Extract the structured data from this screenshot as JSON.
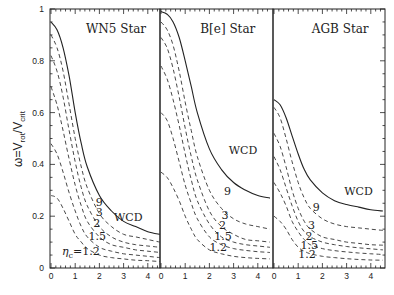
{
  "chart_data": {
    "type": "line",
    "ylabel": "ω=V_rot/V_crit",
    "ylim": [
      0,
      1
    ],
    "xlim": [
      0,
      4.5
    ],
    "yticks": [
      "0",
      "0.2",
      "0.4",
      "0.6",
      "0.8",
      "1"
    ],
    "xticks": [
      "0",
      "1",
      "2",
      "3",
      "4"
    ],
    "panels": [
      {
        "title": "WN5 Star",
        "annotations": [
          {
            "text": "WCD",
            "x": 2.6,
            "y": 0.18
          },
          {
            "text": "9",
            "x": 1.85,
            "y": 0.24
          },
          {
            "text": "3",
            "x": 1.85,
            "y": 0.2
          },
          {
            "text": "2",
            "x": 1.75,
            "y": 0.16
          },
          {
            "text": "1.5",
            "x": 1.55,
            "y": 0.11
          },
          {
            "text": "η_c=1.2",
            "x": 0.45,
            "y": 0.05
          }
        ],
        "series": [
          {
            "name": "WCD",
            "style": "solid",
            "x": [
              0,
              0.25,
              0.5,
              0.75,
              1,
              1.25,
              1.5,
              2,
              2.5,
              3,
              3.5,
              4,
              4.5
            ],
            "y": [
              0.95,
              0.92,
              0.85,
              0.74,
              0.6,
              0.48,
              0.39,
              0.28,
              0.22,
              0.18,
              0.16,
              0.14,
              0.13
            ]
          },
          {
            "name": "9",
            "style": "dashed",
            "x": [
              0,
              0.25,
              0.5,
              0.75,
              1,
              1.25,
              1.5,
              2,
              2.5,
              3,
              3.5,
              4,
              4.5
            ],
            "y": [
              0.9,
              0.85,
              0.76,
              0.63,
              0.5,
              0.39,
              0.31,
              0.21,
              0.16,
              0.13,
              0.12,
              0.11,
              0.1
            ]
          },
          {
            "name": "3",
            "style": "dashed",
            "x": [
              0,
              0.25,
              0.5,
              0.75,
              1,
              1.25,
              1.5,
              2,
              2.5,
              3,
              3.5,
              4,
              4.5
            ],
            "y": [
              0.82,
              0.76,
              0.66,
              0.53,
              0.41,
              0.31,
              0.24,
              0.16,
              0.12,
              0.1,
              0.09,
              0.085,
              0.08
            ]
          },
          {
            "name": "2",
            "style": "dashed",
            "x": [
              0,
              0.25,
              0.5,
              0.75,
              1,
              1.25,
              1.5,
              2,
              2.5,
              3,
              3.5,
              4,
              4.5
            ],
            "y": [
              0.7,
              0.63,
              0.53,
              0.42,
              0.32,
              0.24,
              0.18,
              0.12,
              0.09,
              0.08,
              0.07,
              0.065,
              0.06
            ]
          },
          {
            "name": "1.5",
            "style": "dashed",
            "x": [
              0,
              0.25,
              0.5,
              0.75,
              1,
              1.25,
              1.5,
              2,
              2.5,
              3,
              3.5,
              4,
              4.5
            ],
            "y": [
              0.48,
              0.44,
              0.37,
              0.29,
              0.22,
              0.16,
              0.12,
              0.08,
              0.065,
              0.055,
              0.05,
              0.045,
              0.04
            ]
          },
          {
            "name": "1.2",
            "style": "dashed",
            "x": [
              0,
              0.25,
              0.5,
              0.75,
              1,
              1.25,
              1.5,
              2,
              2.5,
              3,
              3.5,
              4,
              4.5
            ],
            "y": [
              0.28,
              0.27,
              0.23,
              0.18,
              0.13,
              0.1,
              0.075,
              0.05,
              0.04,
              0.035,
              0.03,
              0.028,
              0.025
            ]
          }
        ]
      },
      {
        "title": "B[e] Star",
        "annotations": [
          {
            "text": "WCD",
            "x": 2.8,
            "y": 0.44
          },
          {
            "text": "9",
            "x": 2.6,
            "y": 0.28
          },
          {
            "text": "3",
            "x": 2.5,
            "y": 0.19
          },
          {
            "text": "2",
            "x": 2.4,
            "y": 0.15
          },
          {
            "text": "1.5",
            "x": 2.2,
            "y": 0.11
          },
          {
            "text": "1.2",
            "x": 2.0,
            "y": 0.065
          }
        ],
        "series": [
          {
            "name": "WCD",
            "style": "solid",
            "x": [
              0,
              0.25,
              0.5,
              0.75,
              1,
              1.25,
              1.5,
              2,
              2.5,
              3,
              3.5,
              4,
              4.5
            ],
            "y": [
              0.99,
              0.98,
              0.95,
              0.89,
              0.8,
              0.7,
              0.6,
              0.46,
              0.38,
              0.33,
              0.3,
              0.28,
              0.27
            ]
          },
          {
            "name": "9",
            "style": "dashed",
            "x": [
              0,
              0.25,
              0.5,
              0.75,
              1,
              1.25,
              1.5,
              2,
              2.5,
              3,
              3.5,
              4,
              4.5
            ],
            "y": [
              0.95,
              0.92,
              0.86,
              0.76,
              0.64,
              0.53,
              0.43,
              0.3,
              0.23,
              0.19,
              0.17,
              0.16,
              0.15
            ]
          },
          {
            "name": "3",
            "style": "dashed",
            "x": [
              0,
              0.25,
              0.5,
              0.75,
              1,
              1.25,
              1.5,
              2,
              2.5,
              3,
              3.5,
              4,
              4.5
            ],
            "y": [
              0.89,
              0.85,
              0.77,
              0.66,
              0.54,
              0.43,
              0.34,
              0.22,
              0.16,
              0.13,
              0.11,
              0.105,
              0.1
            ]
          },
          {
            "name": "2",
            "style": "dashed",
            "x": [
              0,
              0.25,
              0.5,
              0.75,
              1,
              1.25,
              1.5,
              2,
              2.5,
              3,
              3.5,
              4,
              4.5
            ],
            "y": [
              0.78,
              0.73,
              0.65,
              0.55,
              0.44,
              0.34,
              0.26,
              0.17,
              0.12,
              0.1,
              0.09,
              0.085,
              0.08
            ]
          },
          {
            "name": "1.5",
            "style": "dashed",
            "x": [
              0,
              0.25,
              0.5,
              0.75,
              1,
              1.25,
              1.5,
              2,
              2.5,
              3,
              3.5,
              4,
              4.5
            ],
            "y": [
              0.6,
              0.57,
              0.5,
              0.41,
              0.32,
              0.25,
              0.19,
              0.12,
              0.09,
              0.075,
              0.068,
              0.063,
              0.06
            ]
          },
          {
            "name": "1.2",
            "style": "dashed",
            "x": [
              0,
              0.25,
              0.5,
              0.75,
              1,
              1.25,
              1.5,
              2,
              2.5,
              3,
              3.5,
              4,
              4.5
            ],
            "y": [
              0.37,
              0.35,
              0.31,
              0.26,
              0.2,
              0.15,
              0.11,
              0.07,
              0.055,
              0.045,
              0.04,
              0.037,
              0.035
            ]
          }
        ]
      },
      {
        "title": "AGB Star",
        "annotations": [
          {
            "text": "WCD",
            "x": 2.9,
            "y": 0.28
          },
          {
            "text": "9",
            "x": 1.6,
            "y": 0.22
          },
          {
            "text": "3",
            "x": 1.4,
            "y": 0.15
          },
          {
            "text": "2",
            "x": 1.3,
            "y": 0.11
          },
          {
            "text": "1.5",
            "x": 1.1,
            "y": 0.075
          },
          {
            "text": "1.2",
            "x": 1.0,
            "y": 0.04
          }
        ],
        "series": [
          {
            "name": "WCD",
            "style": "solid",
            "x": [
              0,
              0.25,
              0.5,
              0.75,
              1,
              1.25,
              1.5,
              2,
              2.5,
              3,
              3.5,
              4,
              4.5
            ],
            "y": [
              0.65,
              0.63,
              0.58,
              0.51,
              0.44,
              0.38,
              0.34,
              0.29,
              0.26,
              0.245,
              0.235,
              0.225,
              0.22
            ]
          },
          {
            "name": "9",
            "style": "dashed",
            "x": [
              0,
              0.25,
              0.5,
              0.75,
              1,
              1.25,
              1.5,
              2,
              2.5,
              3,
              3.5,
              4,
              4.5
            ],
            "y": [
              0.62,
              0.58,
              0.5,
              0.41,
              0.33,
              0.27,
              0.23,
              0.19,
              0.17,
              0.16,
              0.155,
              0.15,
              0.145
            ]
          },
          {
            "name": "3",
            "style": "dashed",
            "x": [
              0,
              0.25,
              0.5,
              0.75,
              1,
              1.25,
              1.5,
              2,
              2.5,
              3,
              3.5,
              4,
              4.5
            ],
            "y": [
              0.52,
              0.47,
              0.39,
              0.3,
              0.23,
              0.18,
              0.15,
              0.12,
              0.11,
              0.1,
              0.095,
              0.09,
              0.088
            ]
          },
          {
            "name": "2",
            "style": "dashed",
            "x": [
              0,
              0.25,
              0.5,
              0.75,
              1,
              1.25,
              1.5,
              2,
              2.5,
              3,
              3.5,
              4,
              4.5
            ],
            "y": [
              0.43,
              0.38,
              0.31,
              0.24,
              0.18,
              0.14,
              0.12,
              0.1,
              0.09,
              0.083,
              0.078,
              0.074,
              0.07
            ]
          },
          {
            "name": "1.5",
            "style": "dashed",
            "x": [
              0,
              0.25,
              0.5,
              0.75,
              1,
              1.25,
              1.5,
              2,
              2.5,
              3,
              3.5,
              4,
              4.5
            ],
            "y": [
              0.33,
              0.29,
              0.24,
              0.18,
              0.14,
              0.11,
              0.09,
              0.075,
              0.067,
              0.062,
              0.058,
              0.055,
              0.052
            ]
          },
          {
            "name": "1.2",
            "style": "dashed",
            "x": [
              0,
              0.25,
              0.5,
              0.75,
              1,
              1.25,
              1.5,
              2,
              2.5,
              3,
              3.5,
              4,
              4.5
            ],
            "y": [
              0.2,
              0.18,
              0.15,
              0.11,
              0.08,
              0.065,
              0.055,
              0.045,
              0.04,
              0.036,
              0.033,
              0.031,
              0.03
            ]
          }
        ]
      }
    ]
  }
}
